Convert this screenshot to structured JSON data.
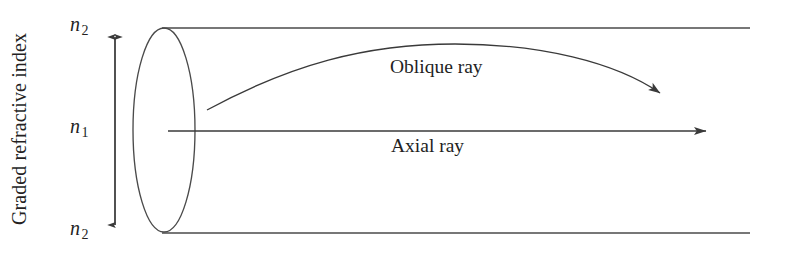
{
  "figure": {
    "background_color": "#ffffff",
    "line_color": "#3a3a3a",
    "text_color": "#241f1f",
    "width": 786,
    "height": 258
  },
  "axis": {
    "caption": "Graded refractive index",
    "arrow": {
      "name": "double-headed-vertical-arrow",
      "x": 115,
      "y_top": 30,
      "y_bottom": 232
    },
    "labels": [
      {
        "symbol": "n",
        "subscript": "2",
        "position": "top",
        "x": 70,
        "y": 28
      },
      {
        "symbol": "n",
        "subscript": "1",
        "position": "middle",
        "x": 70,
        "y": 130
      },
      {
        "symbol": "n",
        "subscript": "2",
        "position": "bottom",
        "x": 70,
        "y": 232
      }
    ]
  },
  "fiber": {
    "end_face_ellipse": {
      "cx": 164,
      "cy": 130,
      "rx": 31,
      "ry": 102
    },
    "top_edge": {
      "x1": 162,
      "y1": 28,
      "x2": 750,
      "y2": 28
    },
    "bottom_edge": {
      "x1": 162,
      "y1": 233,
      "x2": 750,
      "y2": 233
    }
  },
  "rays": [
    {
      "name": "oblique-ray",
      "label": "Oblique ray",
      "label_x": 390,
      "label_y": 68,
      "start": {
        "x": 207,
        "y": 110
      },
      "peak": {
        "x": 450,
        "y": 44
      },
      "end": {
        "x": 667,
        "y": 98
      },
      "arrowhead": "end"
    },
    {
      "name": "axial-ray",
      "label": "Axial ray",
      "label_x": 391,
      "label_y": 147,
      "start": {
        "x": 168,
        "y": 131
      },
      "end": {
        "x": 714,
        "y": 131
      },
      "arrowhead": "end"
    }
  ]
}
